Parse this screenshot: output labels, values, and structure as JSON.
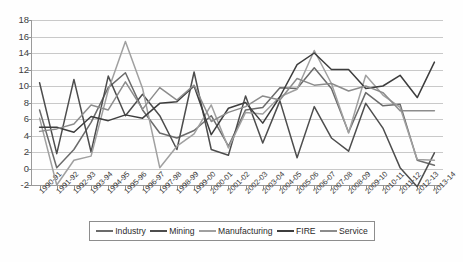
{
  "chart_data": {
    "type": "line",
    "title": "",
    "xlabel": "",
    "ylabel": "",
    "ylim": [
      -2,
      18
    ],
    "ytick_labels": [
      "18",
      "16",
      "14",
      "12",
      "10",
      "8",
      "6",
      "4",
      "2",
      "0",
      "-2"
    ],
    "ytick_values": [
      18,
      16,
      14,
      12,
      10,
      8,
      6,
      4,
      2,
      0,
      -2
    ],
    "grid": true,
    "legend_position": "bottom",
    "categories": [
      "1990-91",
      "1991-92",
      "1992-93",
      "1993-94",
      "1994-95",
      "1995-96",
      "1996-97",
      "1997-98",
      "1998-99",
      "1999-00",
      "2000-01",
      "2001-02",
      "2002-03",
      "2003-04",
      "2004-05",
      "2005-06",
      "2006-07",
      "2007-08",
      "2008-09",
      "2009-10",
      "2010-11",
      "2011-12",
      "2012-13",
      "2013-14"
    ],
    "series": [
      {
        "name": "Industry",
        "color": "#6b6b6b",
        "values": [
          7.1,
          0.1,
          2.3,
          5.6,
          9.8,
          11.6,
          7.1,
          4.3,
          3.7,
          4.6,
          6.4,
          2.7,
          7.1,
          7.4,
          9.8,
          9.7,
          12.2,
          9.7,
          4.4,
          9.2,
          7.6,
          7.8,
          1.0,
          0.4
        ]
      },
      {
        "name": "Mining",
        "color": "#4d4d4d",
        "values": [
          10.4,
          1.8,
          10.8,
          2.0,
          11.2,
          6.4,
          9.0,
          6.4,
          2.3,
          11.7,
          2.3,
          1.6,
          8.8,
          3.1,
          8.2,
          1.3,
          7.5,
          3.7,
          2.1,
          7.9,
          4.9,
          0.1,
          -2.2,
          1.9
        ]
      },
      {
        "name": "Manufacturing",
        "color": "#a0a0a0",
        "values": [
          6.1,
          -2.0,
          1.0,
          1.5,
          9.5,
          15.4,
          9.7,
          0.1,
          2.7,
          4.2,
          7.7,
          2.5,
          6.8,
          6.6,
          8.7,
          9.6,
          14.3,
          10.3,
          4.3,
          11.3,
          8.9,
          7.4,
          1.1,
          1.0
        ]
      },
      {
        "name": "FIRE",
        "color": "#3d3d3d",
        "values": [
          5.0,
          5.0,
          4.4,
          6.3,
          5.8,
          6.5,
          6.1,
          7.9,
          8.1,
          10.0,
          4.1,
          7.3,
          8.0,
          5.5,
          8.7,
          12.6,
          14.0,
          12.0,
          12.0,
          9.7,
          10.0,
          11.3,
          8.6,
          12.9
        ]
      },
      {
        "name": "Service",
        "color": "#8c8c8c",
        "values": [
          4.5,
          4.8,
          5.4,
          7.7,
          7.1,
          10.5,
          7.2,
          9.8,
          8.3,
          10.1,
          5.7,
          6.8,
          7.5,
          8.8,
          8.3,
          10.9,
          10.1,
          10.3,
          9.4,
          10.0,
          9.2,
          7.0,
          7.0,
          7.0
        ]
      }
    ]
  },
  "legend": {
    "items": [
      {
        "label": "Industry",
        "color": "#6b6b6b"
      },
      {
        "label": "Mining",
        "color": "#4d4d4d"
      },
      {
        "label": "Manufacturing",
        "color": "#a0a0a0"
      },
      {
        "label": "FIRE",
        "color": "#3d3d3d"
      },
      {
        "label": "Service",
        "color": "#8c8c8c"
      }
    ]
  }
}
